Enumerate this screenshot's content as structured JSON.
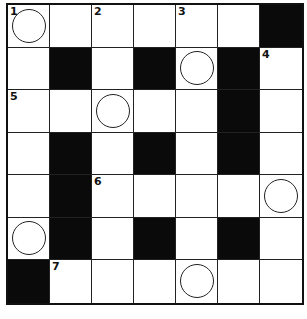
{
  "puzzle": {
    "rows": 7,
    "cols": 7,
    "colors": {
      "black": "#0a0a0a",
      "white": "#ffffff",
      "line": "#222222"
    },
    "grid": [
      [
        {
          "t": "w",
          "n": "1",
          "c": true
        },
        {
          "t": "w"
        },
        {
          "t": "w",
          "n": "2"
        },
        {
          "t": "w"
        },
        {
          "t": "w",
          "n": "3"
        },
        {
          "t": "w"
        },
        {
          "t": "b"
        }
      ],
      [
        {
          "t": "w"
        },
        {
          "t": "b"
        },
        {
          "t": "w"
        },
        {
          "t": "b"
        },
        {
          "t": "w",
          "c": true
        },
        {
          "t": "b"
        },
        {
          "t": "w",
          "n": "4"
        }
      ],
      [
        {
          "t": "w",
          "n": "5"
        },
        {
          "t": "w"
        },
        {
          "t": "w",
          "c": true
        },
        {
          "t": "w"
        },
        {
          "t": "w"
        },
        {
          "t": "b"
        },
        {
          "t": "w"
        }
      ],
      [
        {
          "t": "w"
        },
        {
          "t": "b"
        },
        {
          "t": "w"
        },
        {
          "t": "b"
        },
        {
          "t": "w"
        },
        {
          "t": "b"
        },
        {
          "t": "w"
        }
      ],
      [
        {
          "t": "w"
        },
        {
          "t": "b"
        },
        {
          "t": "w",
          "n": "6"
        },
        {
          "t": "w"
        },
        {
          "t": "w"
        },
        {
          "t": "w"
        },
        {
          "t": "w",
          "c": true
        }
      ],
      [
        {
          "t": "w",
          "c": true
        },
        {
          "t": "b"
        },
        {
          "t": "w"
        },
        {
          "t": "b"
        },
        {
          "t": "w"
        },
        {
          "t": "b"
        },
        {
          "t": "w"
        }
      ],
      [
        {
          "t": "b"
        },
        {
          "t": "w",
          "n": "7"
        },
        {
          "t": "w"
        },
        {
          "t": "w"
        },
        {
          "t": "w",
          "c": true
        },
        {
          "t": "w"
        },
        {
          "t": "w"
        }
      ]
    ]
  }
}
